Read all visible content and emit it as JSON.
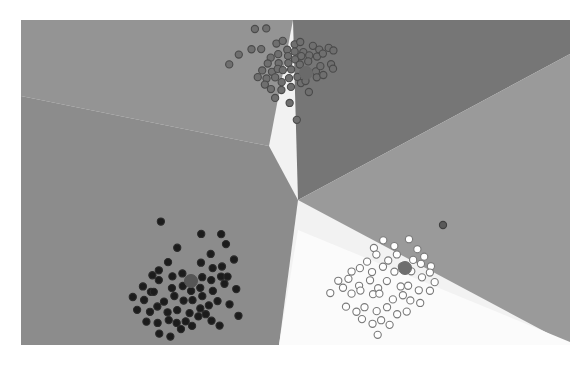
{
  "figure": {
    "title": "",
    "background_color": "#ffffff",
    "plot_bounds": {
      "left": 21,
      "top": 20,
      "width": 549,
      "height": 325
    }
  },
  "chart_data": {
    "type": "scatter",
    "title": "",
    "subtitle": "",
    "xlabel": "",
    "ylabel": "",
    "xlim": [
      0,
      549
    ],
    "ylim": [
      0,
      325
    ],
    "grid": false,
    "legend_position": "none",
    "axis_ticks_visible": false,
    "region_colors": {
      "top_left": "#949494",
      "left_dark": "#7b7b7b",
      "center_wedge": "#8c8c8c",
      "upper_right_dark": "#767676",
      "right_light": "#9a9a9a",
      "lower_right_white": "#fbfbfb"
    },
    "regions": [
      {
        "name": "region-top-left",
        "color": "#949494",
        "polygon": "0,0 272,0 248,126 0,76"
      },
      {
        "name": "region-upper-right-dark",
        "color": "#767676",
        "polygon": "272,0 549,0 549,34 277,180"
      },
      {
        "name": "region-center-wedge",
        "color": "#8c8c8c",
        "polygon": "248,126 0,76 0,325 258,325 277,180"
      },
      {
        "name": "region-right-light",
        "color": "#9a9a9a",
        "polygon": "549,34 549,325 277,180"
      },
      {
        "name": "region-lower-right-white",
        "color": "#fbfbfb",
        "polygon": "277,210 549,322 549,325 258,325"
      }
    ],
    "clusters": [
      {
        "name": "cluster-top",
        "label": "Cluster 1",
        "point_color": "#4a4a4a",
        "point_fill": "#6f6f6f",
        "marker": "circle",
        "n_points": 58,
        "centroid": {
          "x": 285,
          "y": 53,
          "color": "#6a6a6a"
        },
        "points": [
          [
            232,
            11
          ],
          [
            245,
            9
          ],
          [
            218,
            34
          ],
          [
            232,
            30
          ],
          [
            240,
            27
          ],
          [
            254,
            25
          ],
          [
            206,
            43
          ],
          [
            262,
            19
          ],
          [
            250,
            37
          ],
          [
            258,
            33
          ],
          [
            266,
            29
          ],
          [
            274,
            26
          ],
          [
            280,
            22
          ],
          [
            249,
            45
          ],
          [
            258,
            41
          ],
          [
            266,
            37
          ],
          [
            274,
            33
          ],
          [
            282,
            30
          ],
          [
            290,
            26
          ],
          [
            240,
            50
          ],
          [
            249,
            52
          ],
          [
            258,
            48
          ],
          [
            266,
            44
          ],
          [
            274,
            41
          ],
          [
            282,
            37
          ],
          [
            290,
            34
          ],
          [
            298,
            30
          ],
          [
            306,
            28
          ],
          [
            238,
            58
          ],
          [
            247,
            60
          ],
          [
            256,
            56
          ],
          [
            264,
            52
          ],
          [
            272,
            49
          ],
          [
            280,
            45
          ],
          [
            288,
            42
          ],
          [
            296,
            38
          ],
          [
            304,
            35
          ],
          [
            312,
            32
          ],
          [
            243,
            66
          ],
          [
            252,
            68
          ],
          [
            261,
            64
          ],
          [
            269,
            60
          ],
          [
            277,
            57
          ],
          [
            285,
            53
          ],
          [
            293,
            50
          ],
          [
            301,
            46
          ],
          [
            309,
            43
          ],
          [
            253,
            76
          ],
          [
            262,
            72
          ],
          [
            270,
            68
          ],
          [
            278,
            65
          ],
          [
            286,
            61
          ],
          [
            294,
            58
          ],
          [
            302,
            54
          ],
          [
            310,
            50
          ],
          [
            268,
            85
          ],
          [
            290,
            72
          ],
          [
            276,
            100
          ]
        ]
      },
      {
        "name": "cluster-bottom-left",
        "label": "Cluster 2",
        "point_color": "#2b2b2b",
        "point_fill": "#1c1c1c",
        "marker": "circle",
        "n_points": 62,
        "centroid": {
          "x": 170,
          "y": 261,
          "color": "#555555"
        },
        "points": [
          [
            138,
            202
          ],
          [
            178,
            215
          ],
          [
            199,
            212
          ],
          [
            158,
            230
          ],
          [
            146,
            243
          ],
          [
            191,
            232
          ],
          [
            181,
            243
          ],
          [
            130,
            254
          ],
          [
            140,
            250
          ],
          [
            150,
            258
          ],
          [
            160,
            252
          ],
          [
            170,
            261
          ],
          [
            180,
            256
          ],
          [
            190,
            250
          ],
          [
            200,
            245
          ],
          [
            120,
            266
          ],
          [
            130,
            270
          ],
          [
            140,
            262
          ],
          [
            150,
            268
          ],
          [
            160,
            264
          ],
          [
            170,
            272
          ],
          [
            180,
            266
          ],
          [
            190,
            262
          ],
          [
            200,
            258
          ],
          [
            112,
            276
          ],
          [
            122,
            280
          ],
          [
            132,
            274
          ],
          [
            142,
            280
          ],
          [
            152,
            276
          ],
          [
            162,
            282
          ],
          [
            172,
            278
          ],
          [
            182,
            274
          ],
          [
            192,
            270
          ],
          [
            202,
            266
          ],
          [
            118,
            288
          ],
          [
            128,
            292
          ],
          [
            138,
            286
          ],
          [
            148,
            292
          ],
          [
            158,
            288
          ],
          [
            168,
            294
          ],
          [
            178,
            290
          ],
          [
            188,
            285
          ],
          [
            198,
            281
          ],
          [
            126,
            300
          ],
          [
            136,
            304
          ],
          [
            146,
            298
          ],
          [
            156,
            304
          ],
          [
            166,
            300
          ],
          [
            176,
            296
          ],
          [
            186,
            292
          ],
          [
            140,
            312
          ],
          [
            150,
            316
          ],
          [
            160,
            310
          ],
          [
            170,
            306
          ],
          [
            205,
            226
          ],
          [
            213,
            238
          ],
          [
            207,
            255
          ],
          [
            215,
            268
          ],
          [
            209,
            285
          ],
          [
            217,
            297
          ],
          [
            199,
            305
          ],
          [
            191,
            300
          ]
        ]
      },
      {
        "name": "cluster-bottom-right",
        "label": "Cluster 3",
        "point_color": "#7a7a7a",
        "point_fill": "#ffffff",
        "marker": "circle-open",
        "n_points": 55,
        "centroid": {
          "x": 384,
          "y": 248,
          "color": "#6e6e6e"
        },
        "points": [
          [
            352,
            228
          ],
          [
            364,
            221
          ],
          [
            374,
            225
          ],
          [
            386,
            219
          ],
          [
            396,
            228
          ],
          [
            404,
            236
          ],
          [
            412,
            244
          ],
          [
            344,
            240
          ],
          [
            356,
            236
          ],
          [
            368,
            240
          ],
          [
            378,
            234
          ],
          [
            390,
            238
          ],
          [
            400,
            246
          ],
          [
            410,
            252
          ],
          [
            330,
            252
          ],
          [
            340,
            248
          ],
          [
            352,
            252
          ],
          [
            362,
            247
          ],
          [
            372,
            252
          ],
          [
            382,
            247
          ],
          [
            392,
            252
          ],
          [
            402,
            258
          ],
          [
            412,
            262
          ],
          [
            318,
            262
          ],
          [
            328,
            258
          ],
          [
            338,
            264
          ],
          [
            348,
            260
          ],
          [
            358,
            266
          ],
          [
            368,
            262
          ],
          [
            378,
            268
          ],
          [
            388,
            264
          ],
          [
            398,
            270
          ],
          [
            408,
            272
          ],
          [
            310,
            272
          ],
          [
            320,
            268
          ],
          [
            330,
            274
          ],
          [
            340,
            270
          ],
          [
            350,
            276
          ],
          [
            360,
            272
          ],
          [
            370,
            278
          ],
          [
            380,
            274
          ],
          [
            390,
            280
          ],
          [
            400,
            282
          ],
          [
            324,
            286
          ],
          [
            334,
            290
          ],
          [
            344,
            286
          ],
          [
            354,
            292
          ],
          [
            364,
            288
          ],
          [
            374,
            294
          ],
          [
            384,
            290
          ],
          [
            340,
            300
          ],
          [
            350,
            304
          ],
          [
            360,
            300
          ],
          [
            370,
            306
          ],
          [
            356,
            314
          ]
        ]
      }
    ],
    "outlier_points": [
      {
        "name": "outlier-right",
        "x": 422,
        "y": 205,
        "color": "#5a5a5a"
      }
    ],
    "centroid_marker": {
      "shape": "circle",
      "size": 13,
      "description": "Large filled circle marking each cluster centroid"
    }
  },
  "ghost_text": {
    "note": "Faint background bleed-through text fragments visible behind the figure",
    "items": [
      {
        "id": "g1",
        "text": "",
        "x": 180,
        "y": 110
      },
      {
        "id": "g2",
        "text": "",
        "x": 300,
        "y": 270
      }
    ]
  }
}
